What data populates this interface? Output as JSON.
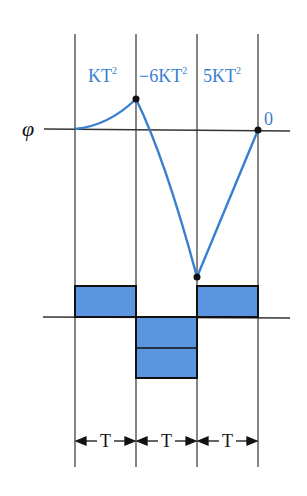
{
  "diagram": {
    "axis_symbol": "φ",
    "colors": {
      "curve": "#3a7fcf",
      "bar_fill": "#5b95e0",
      "line": "#222222",
      "label": "#3a7fcf"
    },
    "segment_labels": [
      {
        "base": "KT",
        "sup": "2"
      },
      {
        "base": "−6KT",
        "sup": "2"
      },
      {
        "base": "5KT",
        "sup": "2"
      }
    ],
    "end_label": "0",
    "interval_labels": [
      "T",
      "T",
      "T"
    ],
    "bars": [
      {
        "interval": 1,
        "direction": "up",
        "units": 1
      },
      {
        "interval": 2,
        "direction": "down",
        "units": 2
      },
      {
        "interval": 3,
        "direction": "up",
        "units": 1
      }
    ]
  }
}
